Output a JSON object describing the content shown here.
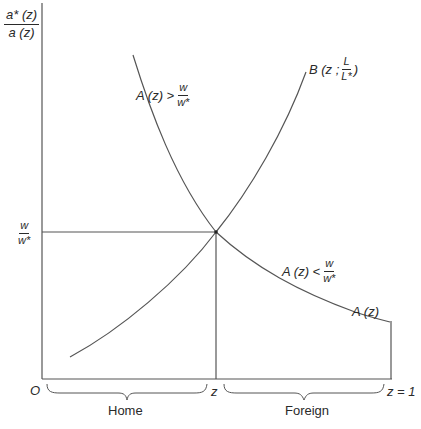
{
  "diagram": {
    "y_axis_label": {
      "numerator": "a* (z)",
      "denominator": "a (z)"
    },
    "y_tick_label": {
      "numerator": "w",
      "denominator": "w*"
    },
    "x_axis": {
      "origin_label": "O",
      "mid_label": "z",
      "end_label": "z = 1",
      "home_label": "Home",
      "foreign_label": "Foreign"
    },
    "curves": {
      "A": {
        "label": "A (z)",
        "description": "downward-sloping demand/comparative advantage schedule"
      },
      "B": {
        "label_prefix": "B (z ;",
        "frac_num": "L",
        "frac_den": "L*",
        "label_suffix": ")"
      }
    },
    "annotations": {
      "above": {
        "text": "A (z) >",
        "frac_num": "w",
        "frac_den": "w*"
      },
      "below": {
        "text": "A (z) <",
        "frac_num": "w",
        "frac_den": "w*"
      }
    },
    "colors": {
      "line": "#555555",
      "text": "#2a2a2a",
      "background": "#ffffff"
    }
  }
}
